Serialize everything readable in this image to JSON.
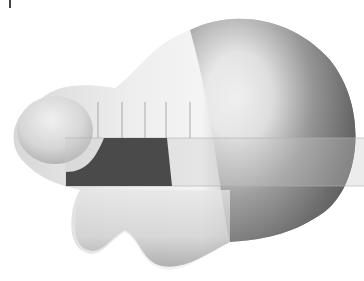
{
  "image": {
    "description": "3D rendered glossy gray blob shape with a semi-transparent grid overlay and a dark trapezoid panel",
    "width": 364,
    "height": 281,
    "background": "#ffffff"
  },
  "colors": {
    "blob_highlight": "#f4f4f4",
    "blob_mid": "#bdbdbd",
    "blob_shadow": "#5e5e5e",
    "panel_dark": "#4a4a4a",
    "overlay_gray": "#c8c8c8",
    "grid_line": "#9a9a9a"
  },
  "shapes": {
    "main_sphere": {
      "cx": 270,
      "cy": 140,
      "r": 92
    },
    "left_lobe": {
      "cx": 55,
      "cy": 130,
      "rx": 40,
      "ry": 38
    },
    "grid_overlay": {
      "x": 65,
      "y": 138,
      "w": 300,
      "h": 48
    },
    "dark_panel": {
      "x": 66,
      "y": 138,
      "w": 110,
      "h": 48
    },
    "vertical_ticks_x": [
      98,
      122,
      145,
      166,
      190
    ]
  }
}
